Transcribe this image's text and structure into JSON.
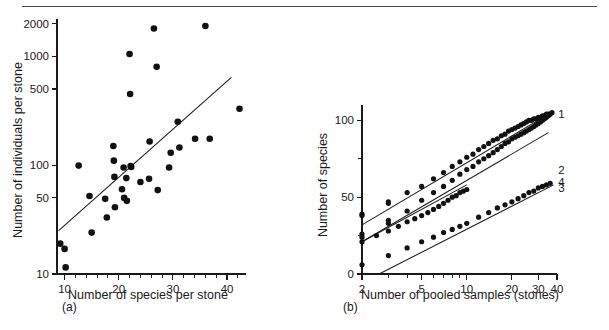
{
  "figure": {
    "top_rule": true,
    "panels": [
      {
        "letter": "(a)",
        "xlabel": "Number of species per stone",
        "ylabel": "Number of individuals per stone"
      },
      {
        "letter": "(b)",
        "xlabel": "Number of pooled samples (stones)",
        "ylabel": "Number of species"
      }
    ]
  },
  "chart_data": [
    {
      "id": "panel-a",
      "type": "scatter",
      "title": "",
      "xlabel": "Number of species per stone",
      "ylabel": "Number of individuals per stone",
      "xscale": "linear",
      "yscale": "log",
      "xlim": [
        8.6,
        43.5
      ],
      "ylim": [
        10,
        2200
      ],
      "xticks": [
        10,
        20,
        30,
        40
      ],
      "xticklabels": [
        "10",
        "20",
        "30",
        "40"
      ],
      "xminorticks": [
        12,
        14,
        16,
        18,
        22,
        24,
        26,
        28,
        32,
        34,
        36,
        38,
        42
      ],
      "yticks": [
        10,
        50,
        100,
        500,
        1000,
        2000
      ],
      "yticklabels": [
        "10",
        "50",
        "100",
        "500",
        "1000",
        "2000"
      ],
      "grid": false,
      "legend": null,
      "points": [
        [
          9.2,
          19
        ],
        [
          10.0,
          17
        ],
        [
          10.2,
          11.5
        ],
        [
          12.6,
          99
        ],
        [
          14.6,
          52
        ],
        [
          15.0,
          24
        ],
        [
          17.5,
          49
        ],
        [
          17.8,
          33
        ],
        [
          19.0,
          150
        ],
        [
          19.1,
          110
        ],
        [
          19.2,
          78
        ],
        [
          19.3,
          41
        ],
        [
          20.6,
          60
        ],
        [
          20.9,
          95
        ],
        [
          21.0,
          50
        ],
        [
          21.4,
          76
        ],
        [
          21.5,
          47
        ],
        [
          22.0,
          1050
        ],
        [
          22.1,
          450
        ],
        [
          22.2,
          98
        ],
        [
          22.3,
          96
        ],
        [
          24.0,
          70
        ],
        [
          25.6,
          75
        ],
        [
          25.7,
          165
        ],
        [
          26.5,
          1800
        ],
        [
          27.0,
          800
        ],
        [
          27.2,
          59
        ],
        [
          29.3,
          95
        ],
        [
          29.6,
          130
        ],
        [
          30.9,
          250
        ],
        [
          31.2,
          145
        ],
        [
          34.1,
          175
        ],
        [
          36.0,
          1900
        ],
        [
          36.8,
          175
        ],
        [
          42.3,
          330
        ]
      ],
      "fit_line": {
        "x": [
          8.9,
          40.8
        ],
        "y": [
          25,
          640
        ]
      },
      "annotations": []
    },
    {
      "id": "panel-b",
      "type": "scatter",
      "title": "",
      "xlabel": "Number of pooled samples (stones)",
      "ylabel": "Number of species",
      "xscale": "log",
      "yscale": "linear",
      "xlim": [
        2,
        40
      ],
      "ylim": [
        0,
        110
      ],
      "xticks": [
        2,
        5,
        10,
        20,
        30,
        40
      ],
      "xticklabels": [
        "2",
        "5",
        "10",
        "20",
        "30",
        "40"
      ],
      "xminorticks": [
        3,
        4,
        6,
        7,
        8,
        9
      ],
      "yticks": [
        0,
        25,
        50,
        75,
        100
      ],
      "yticklabels": [
        "0",
        "",
        "50",
        "",
        "100"
      ],
      "grid": false,
      "legend_position": "right-end-of-curve",
      "series": [
        {
          "name": "1",
          "label": "1",
          "label_x": 39.5,
          "label_y": 104,
          "line": {
            "x": [
              2,
              38
            ],
            "y": [
              32,
              106
            ]
          },
          "x": [
            2,
            2,
            3,
            3,
            4,
            5,
            6,
            7,
            8,
            9,
            10,
            11,
            12,
            13,
            14,
            15,
            16,
            17,
            18,
            19,
            20,
            21,
            22,
            23,
            24,
            25,
            26,
            27,
            28,
            29,
            30,
            31,
            32,
            33,
            34,
            35,
            36,
            37
          ],
          "y": [
            38,
            39,
            46,
            47,
            53,
            57,
            62,
            66,
            70,
            73,
            76,
            78,
            81,
            83,
            85,
            87,
            88,
            90,
            91,
            93,
            94,
            95,
            96,
            97,
            98,
            99,
            100,
            100,
            101,
            101,
            102,
            102,
            103,
            103,
            104,
            104,
            104,
            105
          ]
        },
        {
          "name": "2",
          "label": "2",
          "label_x": 39.5,
          "label_y": 68,
          "line": {
            "x": [
              2,
              35
            ],
            "y": [
              21,
              92
            ]
          },
          "x": [
            2,
            2,
            3,
            3,
            4,
            5,
            6,
            7,
            8,
            9,
            10,
            11,
            12,
            13,
            14,
            15,
            16,
            17,
            18,
            19,
            20,
            21,
            22,
            23,
            24,
            25,
            26,
            27,
            28,
            29,
            30,
            31,
            32,
            33,
            34,
            35
          ],
          "y": [
            24,
            26,
            33,
            35,
            41,
            48,
            53,
            57,
            61,
            65,
            68,
            70,
            73,
            75,
            77,
            79,
            81,
            83,
            85,
            86,
            88,
            89,
            90,
            91,
            92,
            93,
            94,
            95,
            96,
            97,
            98,
            99,
            100,
            101,
            102,
            103
          ]
        },
        {
          "name": "3",
          "label": "3",
          "label_x": 39.5,
          "label_y": 56,
          "line": {
            "x": [
              2,
              10
            ],
            "y": [
              21,
              58
            ]
          },
          "x": [
            2,
            2.5,
            3,
            3.5,
            4,
            4.5,
            5,
            5.5,
            6,
            6.5,
            7,
            7.5,
            8,
            8.5,
            9,
            9.5,
            10
          ],
          "y": [
            21,
            25,
            28,
            31,
            34,
            36,
            38,
            40,
            42,
            44,
            46,
            48,
            50,
            51,
            53,
            54,
            55
          ]
        },
        {
          "name": "4",
          "label": "4",
          "label_x": 39.5,
          "label_y": 60,
          "line": {
            "x": [
              2.6,
              38
            ],
            "y": [
              0,
              58
            ]
          },
          "x": [
            2,
            3,
            4,
            5,
            6,
            7,
            8,
            9,
            10,
            12,
            14,
            16,
            18,
            20,
            22,
            24,
            26,
            28,
            30,
            32,
            34,
            36
          ],
          "y": [
            6,
            12,
            17,
            21,
            24,
            27,
            29,
            31,
            33,
            37,
            40,
            43,
            45,
            47,
            49,
            51,
            53,
            54,
            56,
            57,
            58,
            59
          ]
        }
      ]
    }
  ]
}
